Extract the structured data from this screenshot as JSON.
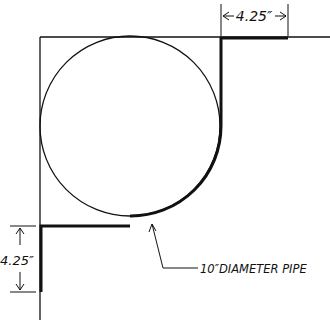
{
  "diagram": {
    "title": "",
    "colors": {
      "ink": "#111111",
      "background": "#ffffff"
    },
    "dimensions": {
      "top": {
        "label": "4.25″"
      },
      "left": {
        "label": "4.25″"
      }
    },
    "callout": {
      "label": "10″DIAMETER PIPE"
    }
  }
}
